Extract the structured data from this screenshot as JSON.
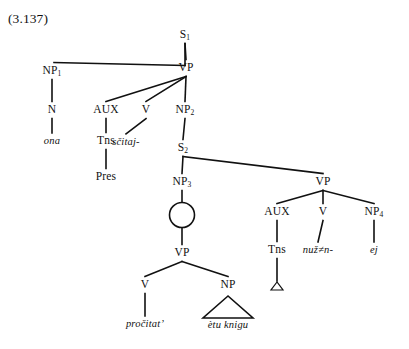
{
  "figure": {
    "number": "(3.137)",
    "caption_number_label": "(3.137)"
  },
  "nodes": {
    "s1": {
      "label": "S",
      "sub": "1",
      "x": 185,
      "y": 35,
      "terminal": false
    },
    "np1": {
      "label": "NP",
      "sub": "1",
      "x": 52,
      "y": 71,
      "terminal": false
    },
    "vp_main": {
      "label": "VP",
      "sub": "",
      "x": 186,
      "y": 68,
      "terminal": false
    },
    "n": {
      "label": "N",
      "sub": "",
      "x": 52,
      "y": 110,
      "terminal": false
    },
    "aux1": {
      "label": "AUX",
      "sub": "",
      "x": 106,
      "y": 110,
      "terminal": false
    },
    "v1": {
      "label": "V",
      "sub": "",
      "x": 146,
      "y": 110,
      "terminal": false
    },
    "np2": {
      "label": "NP",
      "sub": "2",
      "x": 185,
      "y": 110,
      "terminal": false
    },
    "ona": {
      "label": "ona",
      "sub": "",
      "x": 52,
      "y": 141,
      "terminal": true
    },
    "tns1": {
      "label": "Tns",
      "sub": "",
      "x": 106,
      "y": 141,
      "terminal": false
    },
    "scitaj": {
      "label": "sčitaj-",
      "sub": "",
      "x": 126,
      "y": 142,
      "terminal": true
    },
    "s2": {
      "label": "S",
      "sub": "2",
      "x": 183,
      "y": 148,
      "terminal": false
    },
    "pres": {
      "label": "Pres",
      "sub": "",
      "x": 106,
      "y": 177,
      "terminal": false
    },
    "np3": {
      "label": "NP",
      "sub": "3",
      "x": 182,
      "y": 182,
      "terminal": false
    },
    "vp_right": {
      "label": "VP",
      "sub": "",
      "x": 323,
      "y": 182,
      "terminal": false
    },
    "s3": {
      "label": "S",
      "sub": "3",
      "x": 182,
      "y": 215,
      "terminal": false,
      "circled": true
    },
    "aux2": {
      "label": "AUX",
      "sub": "",
      "x": 277,
      "y": 212,
      "terminal": false
    },
    "v2": {
      "label": "V",
      "sub": "",
      "x": 323,
      "y": 212,
      "terminal": false
    },
    "np4": {
      "label": "NP",
      "sub": "4",
      "x": 374,
      "y": 212,
      "terminal": false
    },
    "vp_lower": {
      "label": "VP",
      "sub": "",
      "x": 182,
      "y": 253,
      "terminal": false
    },
    "tns2": {
      "label": "Tns",
      "sub": "",
      "x": 277,
      "y": 250,
      "terminal": false
    },
    "nuzn": {
      "label": "nuž≠n-",
      "sub": "",
      "x": 318,
      "y": 250,
      "terminal": true
    },
    "ej": {
      "label": "ej",
      "sub": "",
      "x": 374,
      "y": 250,
      "terminal": true
    },
    "v3": {
      "label": "V",
      "sub": "",
      "x": 145,
      "y": 285,
      "terminal": false
    },
    "np5": {
      "label": "NP",
      "sub": "",
      "x": 228,
      "y": 285,
      "terminal": false
    },
    "procitat": {
      "label": "pročitat’",
      "sub": "",
      "x": 145,
      "y": 324,
      "terminal": true
    },
    "etu_knigu": {
      "label": "ètu knigu",
      "sub": "",
      "x": 228,
      "y": 325,
      "terminal": true
    }
  },
  "edges": [
    {
      "name": "s1-to-np1",
      "from": "s1",
      "to": "np1",
      "style": "elbow-left"
    },
    {
      "name": "s1-to-vp-main",
      "from": "s1",
      "to": "vp_main",
      "style": "straight"
    },
    {
      "name": "vp-main-to-aux",
      "from": "vp_main",
      "to": "aux1",
      "style": "straight"
    },
    {
      "name": "vp-main-to-v",
      "from": "vp_main",
      "to": "v1",
      "style": "straight"
    },
    {
      "name": "vp-main-to-np2",
      "from": "vp_main",
      "to": "np2",
      "style": "straight"
    },
    {
      "name": "np1-to-n",
      "from": "np1",
      "to": "n",
      "style": "straight"
    },
    {
      "name": "n-to-ona",
      "from": "n",
      "to": "ona",
      "style": "straight"
    },
    {
      "name": "aux-to-tns",
      "from": "aux1",
      "to": "tns1",
      "style": "straight"
    },
    {
      "name": "tns-to-pres",
      "from": "tns1",
      "to": "pres",
      "style": "straight"
    },
    {
      "name": "v-to-scitaj",
      "from": "v1",
      "to": "scitaj",
      "style": "straight"
    },
    {
      "name": "np2-to-s2",
      "from": "np2",
      "to": "s2",
      "style": "straight"
    },
    {
      "name": "s2-to-np3",
      "from": "s2",
      "to": "np3",
      "style": "elbow-down"
    },
    {
      "name": "s2-to-vp-right",
      "from": "s2",
      "to": "vp_right",
      "style": "straight"
    },
    {
      "name": "np3-to-s3",
      "from": "np3",
      "to": "s3",
      "style": "straight"
    },
    {
      "name": "s3-to-vp-lower",
      "from": "s3",
      "to": "vp_lower",
      "style": "straight"
    },
    {
      "name": "vp-right-to-aux2",
      "from": "vp_right",
      "to": "aux2",
      "style": "straight"
    },
    {
      "name": "vp-right-to-v2",
      "from": "vp_right",
      "to": "v2",
      "style": "straight"
    },
    {
      "name": "vp-right-to-np4",
      "from": "vp_right",
      "to": "np4",
      "style": "straight"
    },
    {
      "name": "aux2-to-tns2",
      "from": "aux2",
      "to": "tns2",
      "style": "straight"
    },
    {
      "name": "v2-to-nuzn",
      "from": "v2",
      "to": "nuzn",
      "style": "straight"
    },
    {
      "name": "np4-to-ej",
      "from": "np4",
      "to": "ej",
      "style": "straight"
    },
    {
      "name": "vp-lower-to-v3",
      "from": "vp_lower",
      "to": "v3",
      "style": "straight"
    },
    {
      "name": "vp-lower-to-np5",
      "from": "vp_lower",
      "to": "np5",
      "style": "straight"
    },
    {
      "name": "v3-to-procitat",
      "from": "v3",
      "to": "procitat",
      "style": "straight"
    },
    {
      "name": "tns2-to-delta",
      "from": "tns2",
      "to": "delta",
      "style": "straight"
    }
  ],
  "shapes": {
    "s3_circle": {
      "cx": 182,
      "cy": 215,
      "r": 12.5
    },
    "np_triangle": {
      "apex_x": 228,
      "apex_y": 296,
      "left_x": 203,
      "right_x": 253,
      "base_y": 318
    },
    "delta_triangle": {
      "apex_x": 277,
      "apex_y": 282,
      "left_x": 271,
      "right_x": 283,
      "base_y": 290
    }
  },
  "colors": {
    "ink": "#111111",
    "background": "#ffffff"
  }
}
